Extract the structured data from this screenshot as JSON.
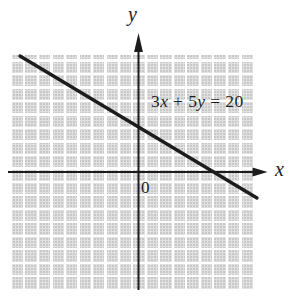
{
  "colors": {
    "ink": "#1c1c1c",
    "text": "#1d1d1d",
    "grid_fill": "#e1e1e1",
    "grid_line": "#ffffff",
    "background": "#ffffff"
  },
  "labels": {
    "y_axis": "y",
    "x_axis": "x",
    "origin": "0"
  },
  "equation": {
    "text": "3x + 5y = 20",
    "segments": [
      {
        "text": "3",
        "italic": false
      },
      {
        "text": "x",
        "italic": true
      },
      {
        "text": " + 5",
        "italic": false
      },
      {
        "text": "y",
        "italic": true
      },
      {
        "text": " = 20",
        "italic": false
      }
    ]
  },
  "chart_data": {
    "type": "line",
    "title": "",
    "equation": "3x + 5y = 20",
    "xlabel": "x",
    "ylabel": "y",
    "slope": -0.6,
    "y_intercept": 4,
    "x_intercept": 6.67,
    "series": [
      {
        "name": "3x + 5y = 20",
        "points": [
          {
            "x": -10.5,
            "y": 10.3
          },
          {
            "x": 0,
            "y": 4
          },
          {
            "x": 6.67,
            "y": 0
          },
          {
            "x": 10.6,
            "y": -2.3
          }
        ]
      }
    ],
    "grid": "on",
    "tick_labels": [],
    "axis_range_estimate": {
      "x": [
        -11.4,
        10.2
      ],
      "y": [
        -10.6,
        10.4
      ]
    },
    "legend": "none",
    "annotations": [
      {
        "text": "3x + 5y = 20",
        "position": "upper-right-of-y-axis"
      },
      {
        "text": "0",
        "position": "below-right-of-origin"
      }
    ]
  }
}
